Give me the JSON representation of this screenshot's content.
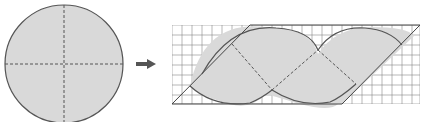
{
  "diagram": {
    "colors": {
      "fill": "#d9d9d9",
      "stroke": "#555555",
      "grid": "#777777",
      "arrow": "#555555",
      "background": "#ffffff"
    },
    "circle": {
      "cx": 64,
      "cy": 64,
      "r": 59
    },
    "arrow": {
      "direction": "right"
    },
    "grid": {
      "x0": 172,
      "y0": 25,
      "x1": 420,
      "y1": 104,
      "cell": 10
    },
    "parallelogram": {
      "points": "172,104 250,25 420,25 342,104"
    }
  }
}
